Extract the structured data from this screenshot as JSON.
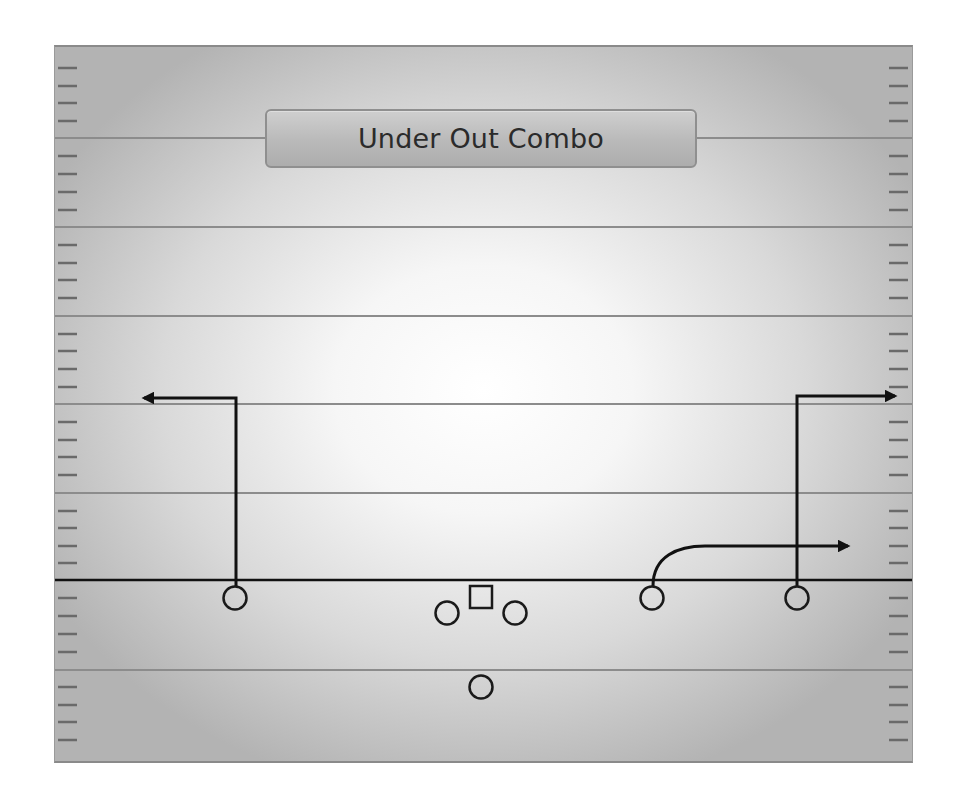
{
  "play": {
    "title": "Under Out Combo"
  },
  "field": {
    "yard_lines_y": [
      138,
      227,
      316,
      404,
      493,
      670
    ],
    "line_of_scrimmage_y": 580,
    "colors": {
      "yard_line": "#8a8a8a",
      "route": "#111111",
      "hash": "#6f6f6f"
    }
  },
  "players": [
    {
      "role": "left-receiver",
      "shape": "circle",
      "x": 235,
      "y": 598
    },
    {
      "role": "left-guard",
      "shape": "circle",
      "x": 447,
      "y": 613
    },
    {
      "role": "center",
      "shape": "square",
      "x": 481,
      "y": 597
    },
    {
      "role": "right-guard",
      "shape": "circle",
      "x": 515,
      "y": 613
    },
    {
      "role": "quarterback",
      "shape": "circle",
      "x": 481,
      "y": 687
    },
    {
      "role": "slot-receiver",
      "shape": "circle",
      "x": 652,
      "y": 598
    },
    {
      "role": "right-receiver",
      "shape": "circle",
      "x": 797,
      "y": 598
    }
  ],
  "routes": [
    {
      "name": "left-out-route",
      "label": "Out"
    },
    {
      "name": "slot-under-route",
      "label": "Under"
    },
    {
      "name": "right-out-route",
      "label": "Out"
    }
  ]
}
